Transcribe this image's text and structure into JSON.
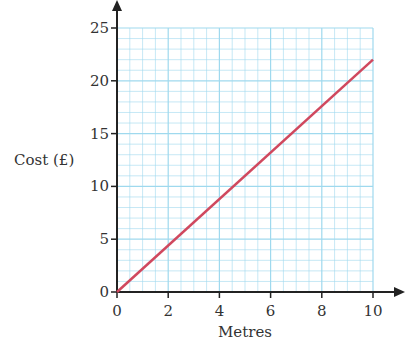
{
  "chart_data": {
    "type": "line",
    "title": "",
    "xlabel": "Metres",
    "ylabel": "Cost (£)",
    "x_ticks": [
      "0",
      "2",
      "4",
      "6",
      "8",
      "10"
    ],
    "y_ticks": [
      "0",
      "5",
      "10",
      "15",
      "20",
      "25"
    ],
    "xlim": [
      0,
      10
    ],
    "ylim": [
      0,
      25
    ],
    "grid": true,
    "series": [
      {
        "name": "Cost",
        "x": [
          0,
          10
        ],
        "y": [
          0,
          22
        ],
        "color": "#d0485e"
      }
    ]
  },
  "colors": {
    "grid": "#9fd9ee",
    "axis": "#222222",
    "line": "#d0485e"
  }
}
